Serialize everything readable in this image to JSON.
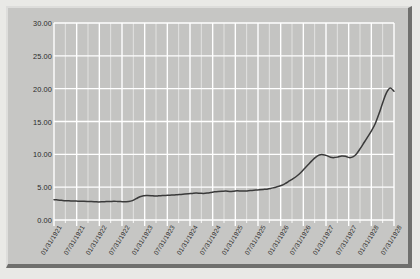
{
  "chart_data": {
    "type": "line",
    "title": "",
    "subtitle": "",
    "xlabel": "",
    "ylabel": "",
    "ylim": [
      0,
      30
    ],
    "ytick_labels": [
      "0.00",
      "5.00",
      "10.00",
      "15.00",
      "20.00",
      "25.00",
      "30.00"
    ],
    "ytick_values": [
      0,
      5,
      10,
      15,
      20,
      25,
      30
    ],
    "grid": true,
    "legend": "none",
    "xtick_labels": [
      "01/31/1921",
      "07/31/1921",
      "01/31/1922",
      "07/31/1922",
      "01/31/1923",
      "07/31/1923",
      "01/31/1924",
      "07/31/1924",
      "01/31/1925",
      "07/31/1925",
      "01/31/1926",
      "07/31/1926",
      "01/31/1927",
      "07/31/1927",
      "01/31/1928",
      "07/31/1928"
    ],
    "series": [
      {
        "name": "series-1",
        "color": "#3a3a3a",
        "x": [
          "01/31/1921",
          "02/28/1921",
          "03/31/1921",
          "04/30/1921",
          "05/31/1921",
          "06/30/1921",
          "07/31/1921",
          "08/31/1921",
          "09/30/1921",
          "10/31/1921",
          "11/30/1921",
          "12/31/1921",
          "01/31/1922",
          "02/28/1922",
          "03/31/1922",
          "04/30/1922",
          "05/31/1922",
          "06/30/1922",
          "07/31/1922",
          "08/31/1922",
          "09/30/1922",
          "10/31/1922",
          "11/30/1922",
          "12/31/1922",
          "01/31/1923",
          "02/28/1923",
          "03/31/1923",
          "04/30/1923",
          "05/31/1923",
          "06/30/1923",
          "07/31/1923",
          "08/31/1923",
          "09/30/1923",
          "10/31/1923",
          "11/30/1923",
          "12/31/1923",
          "01/31/1924",
          "02/29/1924",
          "03/31/1924",
          "04/30/1924",
          "05/31/1924",
          "06/30/1924",
          "07/31/1924",
          "08/31/1924",
          "09/30/1924",
          "10/31/1924",
          "11/30/1924",
          "12/31/1924",
          "01/31/1925",
          "02/28/1925",
          "03/31/1925",
          "04/30/1925",
          "05/31/1925",
          "06/30/1925",
          "07/31/1925",
          "08/31/1925",
          "09/30/1925",
          "10/31/1925",
          "11/30/1925",
          "12/31/1925",
          "01/31/1926",
          "02/28/1926",
          "03/31/1926",
          "04/30/1926",
          "05/31/1926",
          "06/30/1926",
          "07/31/1926",
          "08/31/1926",
          "09/30/1926",
          "10/31/1926",
          "11/30/1926",
          "12/31/1926",
          "01/31/1927",
          "02/28/1927",
          "03/31/1927",
          "04/30/1927",
          "05/31/1927",
          "06/30/1927",
          "07/31/1927",
          "08/31/1927",
          "09/30/1927",
          "10/31/1927",
          "11/30/1927",
          "12/31/1927",
          "01/31/1928",
          "02/29/1928",
          "03/31/1928",
          "04/30/1928",
          "05/31/1928",
          "06/30/1928",
          "07/31/1928",
          "08/31/1928"
        ],
        "values": [
          3.1,
          3.05,
          3.0,
          2.95,
          2.92,
          2.9,
          2.88,
          2.86,
          2.85,
          2.83,
          2.8,
          2.78,
          2.76,
          2.78,
          2.8,
          2.82,
          2.85,
          2.83,
          2.8,
          2.78,
          2.8,
          2.95,
          3.25,
          3.55,
          3.7,
          3.72,
          3.7,
          3.65,
          3.68,
          3.72,
          3.75,
          3.78,
          3.8,
          3.85,
          3.9,
          3.95,
          4.0,
          4.05,
          4.1,
          4.08,
          4.05,
          4.1,
          4.2,
          4.3,
          4.35,
          4.38,
          4.4,
          4.35,
          4.38,
          4.45,
          4.42,
          4.4,
          4.45,
          4.5,
          4.55,
          4.6,
          4.65,
          4.7,
          4.8,
          4.95,
          5.1,
          5.3,
          5.6,
          5.95,
          6.3,
          6.7,
          7.2,
          7.8,
          8.4,
          9.0,
          9.55,
          9.9,
          9.95,
          9.8,
          9.55,
          9.5,
          9.6,
          9.75,
          9.7,
          9.5,
          9.6,
          10.1,
          10.9,
          11.8,
          12.7,
          13.6,
          14.7,
          16.2,
          17.9,
          19.4,
          20.1,
          19.6
        ]
      }
    ],
    "annotations": [],
    "note_peak_value": 25.5,
    "note_end_value": 24.8
  },
  "style": {
    "plot_background": "#c4c4c2",
    "grid_color": "#ffffff",
    "line_color": "#3a3a3a",
    "label_color": "#2b2b2b",
    "frame_background": "#c9c9c7",
    "page_background": "#e9e9e6"
  }
}
